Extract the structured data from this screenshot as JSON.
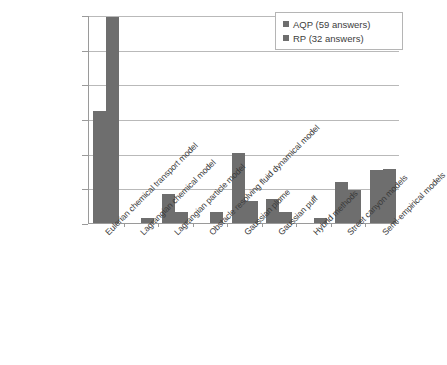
{
  "chart_data": {
    "type": "bar",
    "title": "",
    "subtitle": "",
    "xlabel": "",
    "ylabel": "",
    "ylim": [
      0,
      60
    ],
    "ytick_labels": [
      "0%",
      "10%",
      "20%",
      "30%",
      "40%",
      "50%",
      "60%"
    ],
    "ytick_values": [
      0,
      10,
      20,
      30,
      40,
      50,
      60
    ],
    "grid": true,
    "legend_position": "top-right",
    "value_suffix": "%",
    "categories": [
      "Eulerian chemical transport model",
      "Lagrangian chemical model",
      "Lagrangian particle model",
      "Obstacle resolving fluid dynamical model",
      "Gaussian plume",
      "Gaussian puff",
      "Hybrid methods",
      "Street canyon models",
      "Semi-empirical models"
    ],
    "series": [
      {
        "name": "AQP (59 answers)",
        "color": "#6e6e6e",
        "values": [
          32.2,
          0,
          8.5,
          0,
          20.3,
          6.8,
          0,
          11.9,
          15.2
        ]
      },
      {
        "name": "RP (32 answers)",
        "color": "#6e6e6e",
        "values": [
          59.4,
          1.5,
          3.1,
          3.1,
          6.3,
          3.1,
          1.5,
          9.4,
          15.6
        ]
      }
    ]
  },
  "legend": {
    "entries": [
      {
        "label": "AQP (59 answers)"
      },
      {
        "label": "RP (32 answers)"
      }
    ]
  }
}
